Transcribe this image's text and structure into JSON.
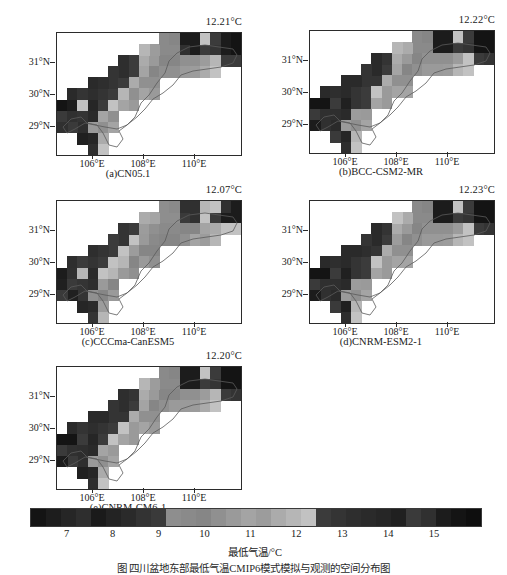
{
  "figure": {
    "caption": "图   四川盆地东部最低气温CMIP6模式模拟与观测的空间分布图",
    "xlabel_ticks": [
      "106°E",
      "108°E",
      "110°E"
    ],
    "ylabel_ticks": [
      "31°N",
      "30°N",
      "29°N"
    ]
  },
  "colorbar": {
    "title": "最低气温/°C",
    "ticks": [
      "7",
      "8",
      "9",
      "10",
      "11",
      "12",
      "13",
      "14",
      "15"
    ],
    "tick_values": [
      7,
      8,
      9,
      10,
      11,
      12,
      13,
      14,
      15
    ],
    "range": [
      6.2,
      16.0
    ],
    "colors": [
      "#141414",
      "#1d1d1d",
      "#262626",
      "#2e2e2e",
      "#1a1a1a",
      "#232323",
      "#2a2a2a",
      "#333333",
      "#3a3a3a",
      "#8e8e8e",
      "#8a8a8a",
      "#868686",
      "#909090",
      "#9a9a9a",
      "#a4a4a4",
      "#9c9c9c",
      "#ababab",
      "#b6b6b6",
      "#c2c2c2",
      "#3b3b3b",
      "#343434",
      "#2e2e2e",
      "#2a2a2a",
      "#262626",
      "#202020",
      "#3a3a3a",
      "#303030",
      "#1c1c1c",
      "#141414",
      "#0e0e0e"
    ]
  },
  "panels": [
    {
      "id": "a",
      "label": "(a)CN05.1",
      "temp": "12.21°C"
    },
    {
      "id": "b",
      "label": "(b)BCC-CSM2-MR",
      "temp": "12.22°C"
    },
    {
      "id": "c",
      "label": "(c)CCCma-CanESM5",
      "temp": "12.07°C"
    },
    {
      "id": "d",
      "label": "(d)CNRM-ESM2-1",
      "temp": "12.23°C"
    },
    {
      "id": "e",
      "label": "(e)CNRM-CM6-1",
      "temp": "12.20°C"
    }
  ],
  "chart_data": {
    "type": "heatmap",
    "xlabel": "经度",
    "ylabel": "纬度",
    "zlabel": "最低气温/°C",
    "xlim": [
      105.0,
      111.2
    ],
    "ylim": [
      28.2,
      31.9
    ],
    "zlim": [
      6.2,
      16.0
    ],
    "grid": false,
    "legend_position": "bottom",
    "cell_size_deg": 0.4,
    "x_ticks": [
      106,
      108,
      110
    ],
    "y_ticks": [
      29,
      30,
      31
    ],
    "panel_mean_values": [
      12.21,
      12.22,
      12.07,
      12.23,
      12.2
    ],
    "panel_names": [
      "CN05.1",
      "BCC-CSM2-MR",
      "CCCma-CanESM5",
      "CNRM-ESM2-1",
      "CNRM-CM6-1"
    ],
    "cells": [
      {
        "col": 0,
        "row": 6,
        "v": 15.6
      },
      {
        "col": 1,
        "row": 6,
        "v": 15.2
      },
      {
        "col": 0,
        "row": 7,
        "v": 14.4
      },
      {
        "col": 1,
        "row": 7,
        "v": 14.8
      },
      {
        "col": 2,
        "row": 7,
        "v": 13.0
      },
      {
        "col": 1,
        "row": 5,
        "v": 13.4
      },
      {
        "col": 2,
        "row": 5,
        "v": 13.0
      },
      {
        "col": 2,
        "row": 6,
        "v": 12.4
      },
      {
        "col": 3,
        "row": 6,
        "v": 14.0
      },
      {
        "col": 3,
        "row": 7,
        "v": 13.6
      },
      {
        "col": 2,
        "row": 8,
        "v": 13.4
      },
      {
        "col": 3,
        "row": 8,
        "v": 10.6
      },
      {
        "col": 4,
        "row": 8,
        "v": 10.2
      },
      {
        "col": 3,
        "row": 5,
        "v": 13.2
      },
      {
        "col": 4,
        "row": 5,
        "v": 12.8
      },
      {
        "col": 4,
        "row": 6,
        "v": 12.6
      },
      {
        "col": 4,
        "row": 7,
        "v": 11.0
      },
      {
        "col": 5,
        "row": 7,
        "v": 10.4
      },
      {
        "col": 5,
        "row": 5,
        "v": 12.6
      },
      {
        "col": 5,
        "row": 6,
        "v": 12.4
      },
      {
        "col": 5,
        "row": 4,
        "v": 13.0
      },
      {
        "col": 6,
        "row": 4,
        "v": 12.8
      },
      {
        "col": 6,
        "row": 5,
        "v": 12.2
      },
      {
        "col": 6,
        "row": 6,
        "v": 10.8
      },
      {
        "col": 6,
        "row": 3,
        "v": 13.2
      },
      {
        "col": 7,
        "row": 3,
        "v": 12.4
      },
      {
        "col": 7,
        "row": 4,
        "v": 11.4
      },
      {
        "col": 7,
        "row": 5,
        "v": 10.4
      },
      {
        "col": 8,
        "row": 2,
        "v": 11.6
      },
      {
        "col": 8,
        "row": 3,
        "v": 11.0
      },
      {
        "col": 8,
        "row": 4,
        "v": 10.2
      },
      {
        "col": 9,
        "row": 2,
        "v": 10.6
      },
      {
        "col": 9,
        "row": 3,
        "v": 10.0
      },
      {
        "col": 9,
        "row": 4,
        "v": 10.4
      },
      {
        "col": 10,
        "row": 1,
        "v": 9.4
      },
      {
        "col": 10,
        "row": 2,
        "v": 9.8
      },
      {
        "col": 10,
        "row": 3,
        "v": 10.2
      },
      {
        "col": 11,
        "row": 1,
        "v": 9.6
      },
      {
        "col": 11,
        "row": 2,
        "v": 10.0
      },
      {
        "col": 11,
        "row": 3,
        "v": 10.4
      },
      {
        "col": 12,
        "row": 1,
        "v": 15.0
      },
      {
        "col": 12,
        "row": 2,
        "v": 10.2
      },
      {
        "col": 12,
        "row": 3,
        "v": 10.6
      },
      {
        "col": 13,
        "row": 1,
        "v": 15.2
      },
      {
        "col": 13,
        "row": 2,
        "v": 10.4
      },
      {
        "col": 13,
        "row": 3,
        "v": 11.0
      },
      {
        "col": 14,
        "row": 1,
        "v": 12.4
      },
      {
        "col": 14,
        "row": 2,
        "v": 11.2
      },
      {
        "col": 14,
        "row": 3,
        "v": 11.6
      },
      {
        "col": 15,
        "row": 1,
        "v": 12.8
      },
      {
        "col": 15,
        "row": 2,
        "v": 12.0
      },
      {
        "col": 15,
        "row": 3,
        "v": 12.2
      },
      {
        "col": 16,
        "row": 1,
        "v": 15.4
      },
      {
        "col": 16,
        "row": 2,
        "v": 12.6
      },
      {
        "col": 17,
        "row": 1,
        "v": 15.6
      },
      {
        "col": 17,
        "row": 2,
        "v": 12.8
      },
      {
        "col": 16,
        "row": 0,
        "v": 15.2
      },
      {
        "col": 17,
        "row": 0,
        "v": 15.4
      },
      {
        "col": 12,
        "row": 0,
        "v": 15.0
      },
      {
        "col": 13,
        "row": 0,
        "v": 15.1
      },
      {
        "col": 14,
        "row": 0,
        "v": 12.2
      },
      {
        "col": 15,
        "row": 0,
        "v": 12.6
      },
      {
        "col": 9,
        "row": 1,
        "v": 11.4
      },
      {
        "col": 8,
        "row": 1,
        "v": 12.0
      },
      {
        "col": 7,
        "row": 2,
        "v": 12.8
      },
      {
        "col": 6,
        "row": 2,
        "v": 13.4
      },
      {
        "col": 4,
        "row": 9,
        "v": 11.8
      },
      {
        "col": 3,
        "row": 9,
        "v": 13.8
      },
      {
        "col": 2,
        "row": 9,
        "v": 14.2
      },
      {
        "col": 5,
        "row": 8,
        "v": 10.8
      },
      {
        "col": 10,
        "row": 0,
        "v": 9.6
      },
      {
        "col": 11,
        "row": 0,
        "v": 9.8
      },
      {
        "col": 1,
        "row": 8,
        "v": 14.6
      },
      {
        "col": 0,
        "row": 8,
        "v": 15.0
      },
      {
        "col": 4,
        "row": 4,
        "v": 13.4
      },
      {
        "col": 3,
        "row": 4,
        "v": 13.6
      },
      {
        "col": 5,
        "row": 3,
        "v": 13.0
      },
      {
        "col": 7,
        "row": 6,
        "v": 10.6
      },
      {
        "col": 8,
        "row": 5,
        "v": 10.8
      },
      {
        "col": 9,
        "row": 5,
        "v": 10.6
      },
      {
        "col": 4,
        "row": 10,
        "v": 12.2
      },
      {
        "col": 3,
        "row": 10,
        "v": 13.2
      }
    ]
  }
}
